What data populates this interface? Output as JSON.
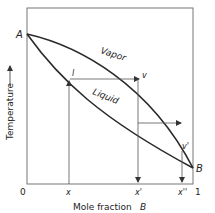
{
  "diagram": {
    "y_axis_label": "Temperature",
    "x_axis_label": "Mole fraction",
    "x_axis_variable": "B",
    "x_tick_labels": {
      "origin": "0",
      "end": "1",
      "x": "x",
      "x_prime": "x'",
      "x_double_prime": "x''"
    },
    "endpoints": {
      "a": "A",
      "b": "B"
    },
    "curves": {
      "vapor": "Vapor",
      "liquid": "Liquid"
    },
    "points": {
      "l": "l",
      "v": "v",
      "v_prime": "v'"
    },
    "colors": {
      "line": "#2a2a2a",
      "thin": "#555555",
      "text": "#222222"
    }
  }
}
